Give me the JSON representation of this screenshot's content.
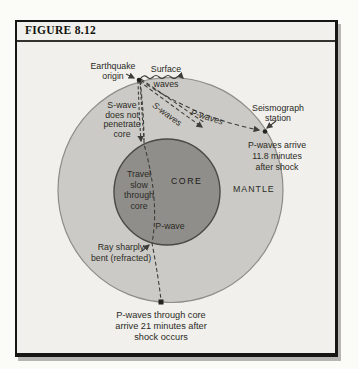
{
  "figure": {
    "title": "FIGURE 8.12"
  },
  "labels": {
    "earthquake_origin": "Earthquake\norigin",
    "surface_waves": "Surface\nwaves",
    "s_wave_note": "S-wave\ndoes not\npenetrate\ncore",
    "s_waves_path": "S-waves",
    "p_waves_path": "P-waves",
    "seismograph_station": "Seismograph\nstation",
    "p_arrival": "P-waves arrive\n11.8 minutes\nafter shock",
    "travel_slow": "Travel\nslow\nthrough\ncore",
    "core": "CORE",
    "p_wave": "P-wave",
    "mantle": "MANTLE",
    "ray_bent": "Ray sharply\nbent (refracted)",
    "p_through_core": "P-waves through core\narrive 21 minutes after\nshock occurs"
  },
  "colors": {
    "page_bg": "#fbfbf8",
    "box_bg": "#f1f0ec",
    "mantle_fill": "#cbcac6",
    "mantle_stroke": "#8d8c88",
    "core_fill": "#8f8e8a",
    "core_stroke": "#4a4942",
    "line": "#3e3d39",
    "text": "#2b2a25"
  }
}
